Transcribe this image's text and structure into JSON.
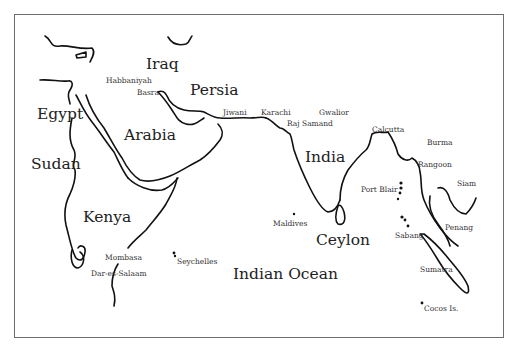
{
  "map": {
    "regions": [
      {
        "id": "iraq",
        "label": "Iraq",
        "x": 146,
        "y": 57,
        "size": "lg"
      },
      {
        "id": "persia",
        "label": "Persia",
        "x": 190,
        "y": 83,
        "size": "lg"
      },
      {
        "id": "egypt",
        "label": "Egypt",
        "x": 37,
        "y": 107,
        "size": "lg"
      },
      {
        "id": "arabia",
        "label": "Arabia",
        "x": 124,
        "y": 128,
        "size": "lg"
      },
      {
        "id": "sudan",
        "label": "Sudan",
        "x": 31,
        "y": 157,
        "size": "lg"
      },
      {
        "id": "india",
        "label": "India",
        "x": 305,
        "y": 150,
        "size": "lg"
      },
      {
        "id": "kenya",
        "label": "Kenya",
        "x": 83,
        "y": 210,
        "size": "lg"
      },
      {
        "id": "ceylon",
        "label": "Ceylon",
        "x": 316,
        "y": 233,
        "size": "lg"
      },
      {
        "id": "indian-ocean",
        "label": "Indian Ocean",
        "x": 233,
        "y": 267,
        "size": "lg"
      }
    ],
    "places": [
      {
        "id": "habbaniyah",
        "label": "Habbaniyah",
        "x": 106,
        "y": 77
      },
      {
        "id": "basra",
        "label": "Basra",
        "x": 137,
        "y": 89
      },
      {
        "id": "jiwani",
        "label": "Jiwani",
        "x": 223,
        "y": 109
      },
      {
        "id": "karachi",
        "label": "Karachi",
        "x": 261,
        "y": 109
      },
      {
        "id": "gwalior",
        "label": "Gwalior",
        "x": 319,
        "y": 109
      },
      {
        "id": "raj-samand",
        "label": "Raj Samand",
        "x": 287,
        "y": 120
      },
      {
        "id": "calcutta",
        "label": "Calcutta",
        "x": 372,
        "y": 126
      },
      {
        "id": "burma",
        "label": "Burma",
        "x": 427,
        "y": 139
      },
      {
        "id": "rangoon",
        "label": "Rangoon",
        "x": 418,
        "y": 161
      },
      {
        "id": "siam",
        "label": "Siam",
        "x": 457,
        "y": 180
      },
      {
        "id": "port-blair",
        "label": "Port Blair",
        "x": 361,
        "y": 186
      },
      {
        "id": "maldives",
        "label": "Maldives",
        "x": 273,
        "y": 220
      },
      {
        "id": "penang",
        "label": "Penang",
        "x": 445,
        "y": 224
      },
      {
        "id": "sabang",
        "label": "Sabang",
        "x": 395,
        "y": 232
      },
      {
        "id": "mombasa",
        "label": "Mombasa",
        "x": 105,
        "y": 254
      },
      {
        "id": "seychelles",
        "label": "Seychelles",
        "x": 177,
        "y": 258
      },
      {
        "id": "sumatra",
        "label": "Sumatra",
        "x": 420,
        "y": 266
      },
      {
        "id": "dar-es-salaam",
        "label": "Dar-es-Salaam",
        "x": 91,
        "y": 270
      },
      {
        "id": "cocos-islands",
        "label": "Cocos Is.",
        "x": 424,
        "y": 305
      }
    ]
  },
  "colors": {
    "ink": "#111111",
    "frame": "#6e6e6e",
    "background": "#ffffff"
  }
}
